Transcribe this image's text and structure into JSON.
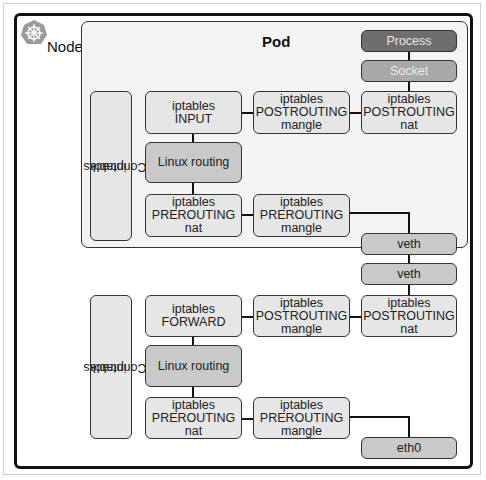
{
  "node": {
    "label": "Node",
    "icon": "kubernetes-helm-icon"
  },
  "pod": {
    "label": "Pod",
    "process": "Process",
    "socket": "Socket",
    "conntrack": [
      "iptables",
      "Conntrack"
    ],
    "input": [
      "iptables",
      "INPUT"
    ],
    "postrouting_mangle": [
      "iptables",
      "POSTROUTING",
      "mangle"
    ],
    "postrouting_nat": [
      "iptables",
      "POSTROUTING",
      "nat"
    ],
    "linux_routing": "Linux routing",
    "prerouting_nat": [
      "iptables",
      "PREROUTING",
      "nat"
    ],
    "prerouting_mangle": [
      "iptables",
      "PREROUTING",
      "mangle"
    ],
    "veth": "veth"
  },
  "host": {
    "veth": "veth",
    "conntrack": [
      "iptables",
      "Conntrack"
    ],
    "forward": [
      "iptables",
      "FORWARD"
    ],
    "postrouting_mangle": [
      "iptables",
      "POSTROUTING",
      "mangle"
    ],
    "postrouting_nat": [
      "iptables",
      "POSTROUTING",
      "nat"
    ],
    "linux_routing": "Linux routing",
    "prerouting_nat": [
      "iptables",
      "PREROUTING",
      "nat"
    ],
    "prerouting_mangle": [
      "iptables",
      "PREROUTING",
      "mangle"
    ],
    "eth0": "eth0"
  },
  "colors": {
    "box": "#e6e6e6",
    "routing": "#c9c9c9",
    "process": "#6e6e6e",
    "socket": "#a9a9a9",
    "pod_bg": "#f4f4f4"
  }
}
